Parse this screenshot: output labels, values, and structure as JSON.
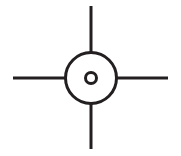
{
  "figure": {
    "background_color": "#ffffff",
    "stroke_color": "#231f20",
    "canvas": {
      "width": 181,
      "height": 156
    }
  },
  "geometry": {
    "center": {
      "x": 91,
      "y": 78
    },
    "outer_circle": {
      "cx": 91,
      "cy": 78,
      "r": 25.5,
      "stroke_width": 3
    },
    "inner_circle": {
      "cx": 91,
      "cy": 78,
      "r": 5.5,
      "stroke_width": 3
    },
    "arms": [
      {
        "name": "top",
        "x1": 91,
        "y1": 6,
        "x2": 91,
        "y2": 52,
        "stroke_width": 3
      },
      {
        "name": "bottom",
        "x1": 91,
        "y1": 104,
        "x2": 91,
        "y2": 149,
        "stroke_width": 3
      },
      {
        "name": "left",
        "x1": 13,
        "y1": 78,
        "x2": 66,
        "y2": 78,
        "stroke_width": 3
      },
      {
        "name": "right",
        "x1": 117,
        "y1": 78,
        "x2": 168,
        "y2": 78,
        "stroke_width": 3
      }
    ]
  }
}
